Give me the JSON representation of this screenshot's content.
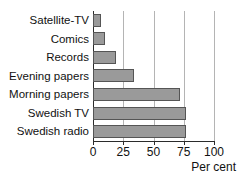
{
  "chart_data": {
    "type": "bar",
    "orientation": "horizontal",
    "title": "",
    "subtitle": "",
    "xlabel": "Per cent",
    "ylabel": "",
    "categories": [
      "Satellite-TV",
      "Comics",
      "Records",
      "Evening papers",
      "Morning papers",
      "Swedish TV",
      "Swedish radio"
    ],
    "values": [
      7,
      10,
      19,
      34,
      72,
      77,
      77
    ],
    "xlim": [
      0,
      100
    ],
    "xticks": [
      0,
      25,
      50,
      75,
      100
    ],
    "xtick_labels": [
      "0",
      "25",
      "50",
      "75",
      "100"
    ],
    "grid": "vertical",
    "legend": "none",
    "bar_color": "#9a9a9a",
    "bar_border_color": "#555555",
    "gridline_color": "#b4b4b4",
    "axis_color": "#2b2b2b"
  },
  "axis": {
    "x_axis_title": "Per cent"
  }
}
